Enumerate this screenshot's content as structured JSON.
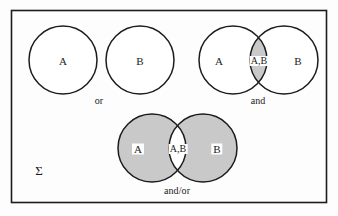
{
  "figure": {
    "frame": {
      "name": "outer-border"
    },
    "colors": {
      "stroke": "#1c1c1c",
      "shade": "#c9c9c9",
      "background": "#fdfdfd",
      "white": "#ffffff"
    },
    "universe_symbol": "Σ",
    "groups": [
      {
        "id": "or",
        "operator_label": "or",
        "overlap": false,
        "shaded": "none",
        "circles": [
          {
            "label": "A",
            "cx": 63,
            "cy": 60,
            "r": 34,
            "fill": "white"
          },
          {
            "label": "B",
            "cx": 140,
            "cy": 60,
            "r": 34,
            "fill": "white"
          }
        ],
        "region_labels": [
          {
            "text": "A",
            "x": 63,
            "y": 61
          },
          {
            "text": "B",
            "x": 140,
            "y": 61
          }
        ],
        "operator_position": {
          "x": 99,
          "y": 101
        }
      },
      {
        "id": "and",
        "operator_label": "and",
        "overlap": true,
        "shaded": "intersection",
        "circles": [
          {
            "label": "A",
            "cx": 233,
            "cy": 60,
            "r": 34,
            "fill": "white"
          },
          {
            "label": "B",
            "cx": 284,
            "cy": 60,
            "r": 34,
            "fill": "white"
          }
        ],
        "region_labels": [
          {
            "text": "A",
            "x": 219,
            "y": 61
          },
          {
            "text": "A,B",
            "x": 259,
            "y": 61
          },
          {
            "text": "B",
            "x": 298,
            "y": 61
          }
        ],
        "operator_position": {
          "x": 258,
          "y": 101
        }
      },
      {
        "id": "and-or",
        "operator_label": "and/or",
        "overlap": true,
        "shaded": "both-circles",
        "circles": [
          {
            "label": "A",
            "cx": 152,
            "cy": 148,
            "r": 34,
            "fill": "shade"
          },
          {
            "label": "B",
            "cx": 203,
            "cy": 148,
            "r": 34,
            "fill": "shade"
          }
        ],
        "region_labels": [
          {
            "text": "A",
            "x": 138,
            "y": 149
          },
          {
            "text": "A,B",
            "x": 178,
            "y": 149
          },
          {
            "text": "B",
            "x": 217,
            "y": 149
          }
        ],
        "operator_position": {
          "x": 177,
          "y": 191
        }
      }
    ],
    "sigma_position": {
      "x": 39,
      "y": 170
    }
  }
}
